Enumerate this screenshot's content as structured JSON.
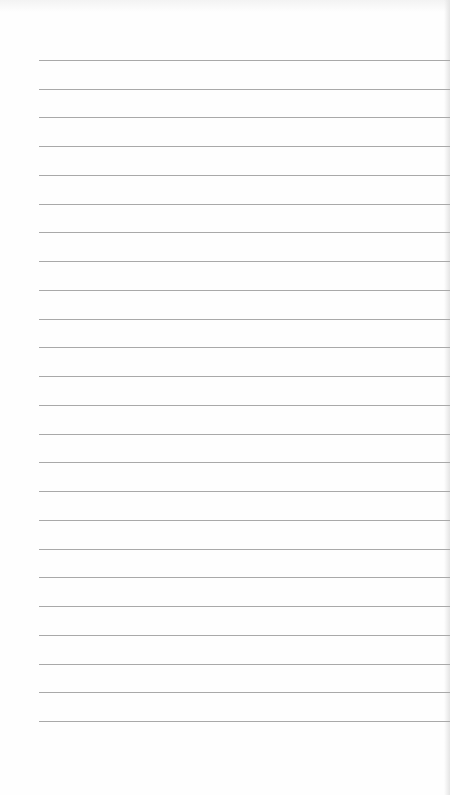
{
  "page": {
    "type": "blank lined notebook paper",
    "line_count": 24,
    "line_color": "#a9a9a9",
    "background_color": "#fefefe",
    "lines": [
      {
        "y": 60
      },
      {
        "y": 89
      },
      {
        "y": 117
      },
      {
        "y": 146
      },
      {
        "y": 175
      },
      {
        "y": 204
      },
      {
        "y": 232
      },
      {
        "y": 261
      },
      {
        "y": 290
      },
      {
        "y": 319
      },
      {
        "y": 347
      },
      {
        "y": 376
      },
      {
        "y": 405
      },
      {
        "y": 434
      },
      {
        "y": 462
      },
      {
        "y": 491
      },
      {
        "y": 520
      },
      {
        "y": 549
      },
      {
        "y": 577
      },
      {
        "y": 606
      },
      {
        "y": 635
      },
      {
        "y": 664
      },
      {
        "y": 692
      },
      {
        "y": 721
      }
    ]
  }
}
